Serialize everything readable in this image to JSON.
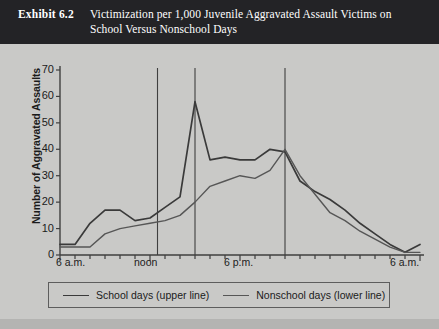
{
  "header": {
    "exhibit_label": "Exhibit 6.2",
    "title_line1": "Victimization per 1,000 Juvenile Aggravated Assault Victims on",
    "title_line2": "School Versus Nonschool Days"
  },
  "legend": {
    "series1_label": "School days (upper line)",
    "series2_label": "Nonschool days (lower line)"
  },
  "colors": {
    "header_bg": "#232326",
    "page_bg": "#c9c9c7",
    "series1": "#3a3a3a",
    "series2": "#565656",
    "axis": "#3f3f3f"
  },
  "chart_data": {
    "type": "line",
    "title": "Victimization per 1,000 Juvenile Aggravated Assault Victims on School Versus Nonschool Days",
    "xlabel": "",
    "ylabel": "Number of Aggravated Assaults",
    "ylim": [
      0,
      70
    ],
    "yticks": [
      0,
      10,
      20,
      30,
      40,
      50,
      60,
      70
    ],
    "grid": false,
    "legend_position": "bottom",
    "x": [
      "6 a.m.",
      "7 a.m.",
      "8 a.m.",
      "9 a.m.",
      "10 a.m.",
      "11 a.m.",
      "noon",
      "1 p.m.",
      "2 p.m.",
      "3 p.m.",
      "4 p.m.",
      "5 p.m.",
      "6 p.m.",
      "7 p.m.",
      "8 p.m.",
      "9 p.m.",
      "10 p.m.",
      "11 p.m.",
      "midnight",
      "1 a.m.",
      "2 a.m.",
      "3 a.m.",
      "4 a.m.",
      "5 a.m.",
      "6 a.m."
    ],
    "xtick_labels": [
      {
        "label": "6 a.m.",
        "index": 0
      },
      {
        "label": "noon",
        "index": 6
      },
      {
        "label": "6 p.m.",
        "index": 12
      },
      {
        "label": "6 a.m.",
        "index": 24
      }
    ],
    "vertical_reference_lines": [
      6.5,
      9,
      15
    ],
    "series": [
      {
        "name": "School days (upper line)",
        "values": [
          4,
          4,
          12,
          17,
          17,
          13,
          14,
          18,
          22,
          58,
          36,
          37,
          36,
          36,
          40,
          39,
          28,
          24,
          21,
          17,
          12,
          8,
          4,
          1,
          4
        ]
      },
      {
        "name": "Nonschool days (lower line)",
        "values": [
          3,
          3,
          3,
          8,
          10,
          11,
          12,
          13,
          15,
          20,
          26,
          28,
          30,
          29,
          32,
          40,
          30,
          23,
          16,
          13,
          9,
          6,
          3,
          1,
          1
        ]
      }
    ]
  }
}
